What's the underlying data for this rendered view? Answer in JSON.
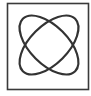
{
  "icon": {
    "name": "orbit-icon",
    "description": "Square frame containing two intersecting ellipses rotated at +45 and -45 degrees",
    "stroke_color": "#333333",
    "frame_color": "#3a3a3a",
    "background": "#ffffff"
  }
}
